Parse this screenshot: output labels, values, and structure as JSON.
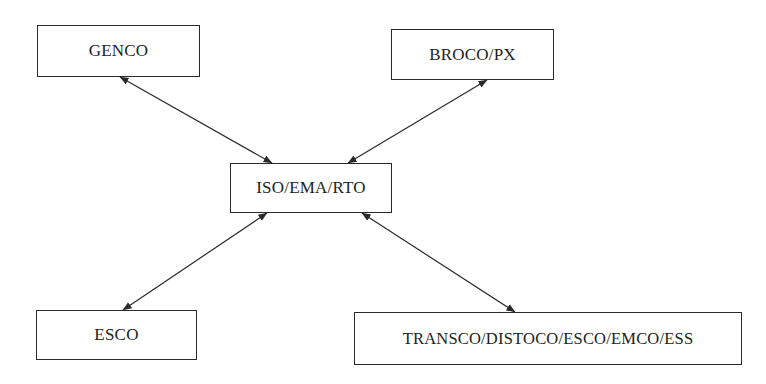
{
  "diagram": {
    "type": "hub-and-spoke",
    "hub": {
      "id": "iso",
      "label": "ISO/EMA/RTO"
    },
    "nodes": {
      "genco": {
        "label": "GENCO"
      },
      "broco": {
        "label": "BROCO/PX"
      },
      "iso": {
        "label": "ISO/EMA/RTO"
      },
      "esco": {
        "label": "ESCO"
      },
      "transco": {
        "label": "TRANSCO/DISTOCO/ESCO/EMCO/ESS"
      }
    },
    "edges": [
      {
        "from": "genco",
        "to": "iso",
        "direction": "bidirectional"
      },
      {
        "from": "broco",
        "to": "iso",
        "direction": "bidirectional"
      },
      {
        "from": "iso",
        "to": "esco",
        "direction": "bidirectional"
      },
      {
        "from": "iso",
        "to": "transco",
        "direction": "bidirectional"
      }
    ],
    "colors": {
      "stroke": "#2a2a2a",
      "text": "#222222",
      "background": "#ffffff"
    }
  }
}
